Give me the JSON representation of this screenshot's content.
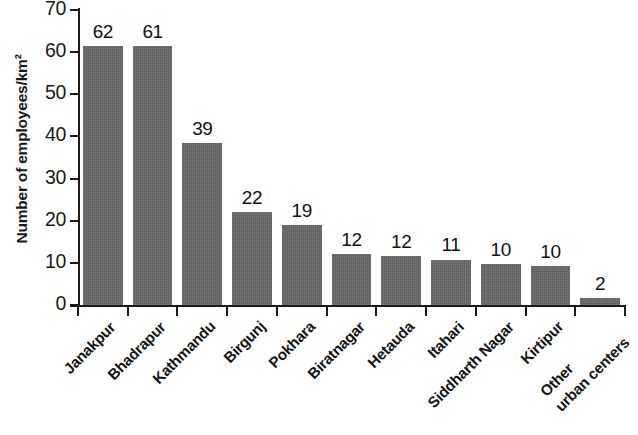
{
  "chart_data": {
    "type": "bar",
    "title": "",
    "subtitle": "",
    "xlabel": "",
    "ylabel": "Number of employees/km²",
    "ylim": [
      0,
      70
    ],
    "ytick_values": [
      0,
      10,
      20,
      30,
      40,
      50,
      60,
      70
    ],
    "ytick_labels": [
      "0",
      "10",
      "20",
      "30",
      "40",
      "50",
      "60",
      "70"
    ],
    "grid": false,
    "legend": "none",
    "bar_color": "#676767",
    "axis_color": "#1a1a1a",
    "categories": [
      "Janakpur",
      "Bhadrapur",
      "Kathmandu",
      "Birgunj",
      "Pokhara",
      "Biratnagar",
      "Hetauda",
      "Itahari",
      "Siddharth Nagar",
      "Kirtipur",
      "Other urban centers"
    ],
    "category_lines": [
      [
        "Janakpur"
      ],
      [
        "Bhadrapur"
      ],
      [
        "Kathmandu"
      ],
      [
        "Birgunj"
      ],
      [
        "Pokhara"
      ],
      [
        "Biratnagar"
      ],
      [
        "Hetauda"
      ],
      [
        "Itahari"
      ],
      [
        "Siddharth Nagar"
      ],
      [
        "Kirtipur"
      ],
      [
        "Other",
        "urban centers"
      ]
    ],
    "values": [
      62,
      61,
      39,
      22,
      19,
      12,
      12,
      11,
      10,
      10,
      2
    ],
    "data_labels": [
      "62",
      "61",
      "39",
      "22",
      "19",
      "12",
      "12",
      "11",
      "10",
      "10",
      "2"
    ],
    "bar_plot_heights": [
      61.5,
      61.5,
      38.5,
      22.0,
      19.0,
      12.0,
      11.7,
      10.8,
      9.7,
      9.3,
      1.7
    ]
  }
}
